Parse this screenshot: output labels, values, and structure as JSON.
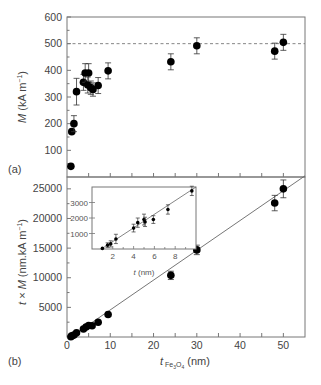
{
  "chart_data": [
    {
      "panel": "(a)",
      "type": "scatter",
      "xlabel": "",
      "ylabel": "M (kA m⁻¹)",
      "xlim": [
        0,
        55
      ],
      "ylim": [
        0,
        600
      ],
      "yticks": [
        100,
        200,
        300,
        400,
        500,
        600
      ],
      "reference_line": {
        "y": 500,
        "style": "dashed"
      },
      "points": [
        {
          "x": 0.9,
          "y": 40,
          "err": 0
        },
        {
          "x": 1.1,
          "y": 170,
          "err": 0
        },
        {
          "x": 1.6,
          "y": 200,
          "err": 30
        },
        {
          "x": 2.2,
          "y": 320,
          "err": 50
        },
        {
          "x": 3.8,
          "y": 355,
          "err": 30
        },
        {
          "x": 4.2,
          "y": 390,
          "err": 35
        },
        {
          "x": 5.0,
          "y": 390,
          "err": 35
        },
        {
          "x": 4.8,
          "y": 345,
          "err": 30
        },
        {
          "x": 5.5,
          "y": 335,
          "err": 25
        },
        {
          "x": 6.0,
          "y": 328,
          "err": 25
        },
        {
          "x": 7.2,
          "y": 343,
          "err": 30
        },
        {
          "x": 9.5,
          "y": 398,
          "err": 30
        },
        {
          "x": 24,
          "y": 432,
          "err": 30
        },
        {
          "x": 30,
          "y": 492,
          "err": 30
        },
        {
          "x": 48,
          "y": 472,
          "err": 30
        },
        {
          "x": 50,
          "y": 505,
          "err": 30
        }
      ]
    },
    {
      "panel": "(b)",
      "type": "scatter",
      "xlabel": "t Fe3O4 (nm)",
      "ylabel": "t × M (nm.kA m⁻¹)",
      "xlim": [
        0,
        55
      ],
      "ylim": [
        0,
        27000
      ],
      "xticks": [
        0,
        10,
        20,
        30,
        40,
        50
      ],
      "yticks": [
        5000,
        10000,
        15000,
        20000,
        25000
      ],
      "fit_line": {
        "x0": 0.9,
        "y0": 0,
        "x1": 55,
        "y1": 27200
      },
      "points": [
        {
          "x": 0.9,
          "y": 40,
          "err": 0
        },
        {
          "x": 1.1,
          "y": 190,
          "err": 0
        },
        {
          "x": 1.6,
          "y": 320,
          "err": 0
        },
        {
          "x": 2.2,
          "y": 700,
          "err": 0
        },
        {
          "x": 3.8,
          "y": 1350,
          "err": 0
        },
        {
          "x": 4.4,
          "y": 1700,
          "err": 0
        },
        {
          "x": 5.0,
          "y": 1950,
          "err": 0
        },
        {
          "x": 5.8,
          "y": 1900,
          "err": 0
        },
        {
          "x": 7.2,
          "y": 2500,
          "err": 0
        },
        {
          "x": 9.5,
          "y": 3800,
          "err": 0
        },
        {
          "x": 24,
          "y": 10400,
          "err": 700
        },
        {
          "x": 30,
          "y": 14700,
          "err": 800
        },
        {
          "x": 48,
          "y": 22600,
          "err": 1300
        },
        {
          "x": 50,
          "y": 25000,
          "err": 1500
        }
      ],
      "inset": {
        "xlabel": "t (nm)",
        "ylabel": "",
        "xlim": [
          0,
          10
        ],
        "ylim": [
          0,
          4000
        ],
        "xticks": [
          2,
          4,
          6,
          8
        ],
        "yticks": [
          1000,
          2000,
          3000
        ],
        "fit_line": {
          "x0": 0.9,
          "y0": 0,
          "x1": 10,
          "y1": 4000
        },
        "points": [
          {
            "x": 1.0,
            "y": 40,
            "err": 0
          },
          {
            "x": 1.5,
            "y": 250,
            "err": 150
          },
          {
            "x": 1.8,
            "y": 330,
            "err": 200
          },
          {
            "x": 2.3,
            "y": 650,
            "err": 300
          },
          {
            "x": 4.0,
            "y": 1350,
            "err": 250
          },
          {
            "x": 4.4,
            "y": 1700,
            "err": 300
          },
          {
            "x": 5.0,
            "y": 1900,
            "err": 350
          },
          {
            "x": 5.1,
            "y": 1750,
            "err": 300
          },
          {
            "x": 5.9,
            "y": 1900,
            "err": 250
          },
          {
            "x": 7.3,
            "y": 2550,
            "err": 300
          },
          {
            "x": 9.6,
            "y": 3750,
            "err": 300
          }
        ]
      }
    }
  ],
  "labels": {
    "panel_a": "(a)",
    "panel_b": "(b)",
    "ylabel_a_var": "M",
    "ylabel_a_unit": " (kA m",
    "ylabel_a_exp": "−1",
    "ylabel_a_close": ")",
    "ylabel_b_var1": "t",
    "ylabel_b_mid": " × ",
    "ylabel_b_var2": "M",
    "ylabel_b_unit": " (nm.kA m",
    "ylabel_b_exp": "−1",
    "ylabel_b_close": ")",
    "xlabel_var": "t",
    "xlabel_sub": " Fe",
    "xlabel_sub2": "3",
    "xlabel_sub3": "O",
    "xlabel_sub4": "4",
    "xlabel_unit": " (nm)",
    "inset_xlabel_var": "t",
    "inset_xlabel_unit": " (nm)"
  },
  "ticks": {
    "a_y": [
      "100",
      "200",
      "300",
      "400",
      "500",
      "600"
    ],
    "b_y": [
      "5000",
      "10000",
      "15000",
      "20000",
      "25000"
    ],
    "b_x": [
      "0",
      "10",
      "20",
      "30",
      "40",
      "50"
    ],
    "inset_x": [
      "2",
      "4",
      "6",
      "8"
    ],
    "inset_y": [
      "1000",
      "2000",
      "3000"
    ]
  }
}
